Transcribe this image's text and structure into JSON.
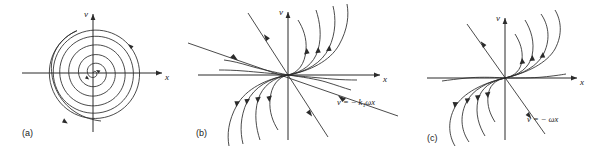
{
  "figure": {
    "type": "phase-portrait-figure",
    "background_color": "#ffffff",
    "stroke_color": "#2b2b2b",
    "panel_count": 3
  },
  "panels": [
    {
      "id": "a",
      "caption": "(a)",
      "portrait_type": "stable spiral (focus)",
      "axis_x_label": "x",
      "axis_v_label": "v",
      "equation_label": "",
      "turns": 4,
      "direction": "clockwise inward"
    },
    {
      "id": "b",
      "caption": "(b)",
      "portrait_type": "stable node with asymptote",
      "axis_x_label": "x",
      "axis_v_label": "v",
      "equation_label": "v = − k₁ωx",
      "equation_parts": {
        "v": "v",
        "equals": "=",
        "minus": "−",
        "k": "k",
        "subscript": "1",
        "omega": "ω",
        "x": "x"
      },
      "direction": "inward toward origin"
    },
    {
      "id": "c",
      "caption": "(c)",
      "portrait_type": "degenerate (improper) node",
      "axis_x_label": "x",
      "axis_v_label": "v",
      "equation_label": "v = − ωx",
      "equation_parts": {
        "v": "v",
        "equals": "=",
        "minus": "−",
        "omega": "ω",
        "x": "x"
      },
      "direction": "inward toward origin"
    }
  ]
}
